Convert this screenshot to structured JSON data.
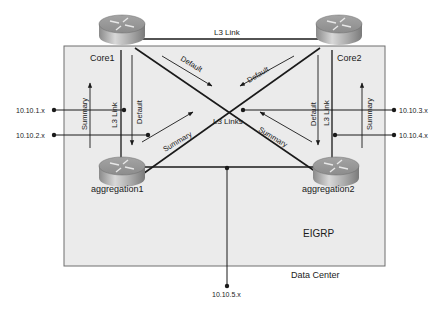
{
  "diagram": {
    "region_label": "Data Center",
    "protocol_label": "EIGRP",
    "colors": {
      "region_fill": "#ebebeb",
      "region_stroke": "#6e6e6e",
      "line": "#1a1a1a",
      "router_top": "#9a9a9a",
      "router_side": "#bdbdbd"
    },
    "nodes": [
      {
        "id": "core1",
        "label": "Core1",
        "type": "router"
      },
      {
        "id": "core2",
        "label": "Core2",
        "type": "router"
      },
      {
        "id": "aggregation1",
        "label": "aggregation1",
        "type": "router"
      },
      {
        "id": "aggregation2",
        "label": "aggregation2",
        "type": "router"
      }
    ],
    "links": {
      "core_link": "L3 Link",
      "left_vertical": "L3 Link",
      "right_vertical": "L3 Link",
      "cross": "L3 Links"
    },
    "route_labels": {
      "default_left_vertical": "Default",
      "default_right_vertical": "Default",
      "default_core1_diag": "Default",
      "default_core2_diag": "Default",
      "summary_left": "Summary",
      "summary_right": "Summary",
      "summary_agg1_diag": "Summary",
      "summary_agg2_diag": "Summary"
    },
    "networks": [
      {
        "id": "net1",
        "label": "10.10.1.x"
      },
      {
        "id": "net2",
        "label": "10.10.2.x"
      },
      {
        "id": "net3",
        "label": "10.10.3.x"
      },
      {
        "id": "net4",
        "label": "10.10.4.x"
      },
      {
        "id": "net5",
        "label": "10.10.5.x"
      }
    ]
  }
}
